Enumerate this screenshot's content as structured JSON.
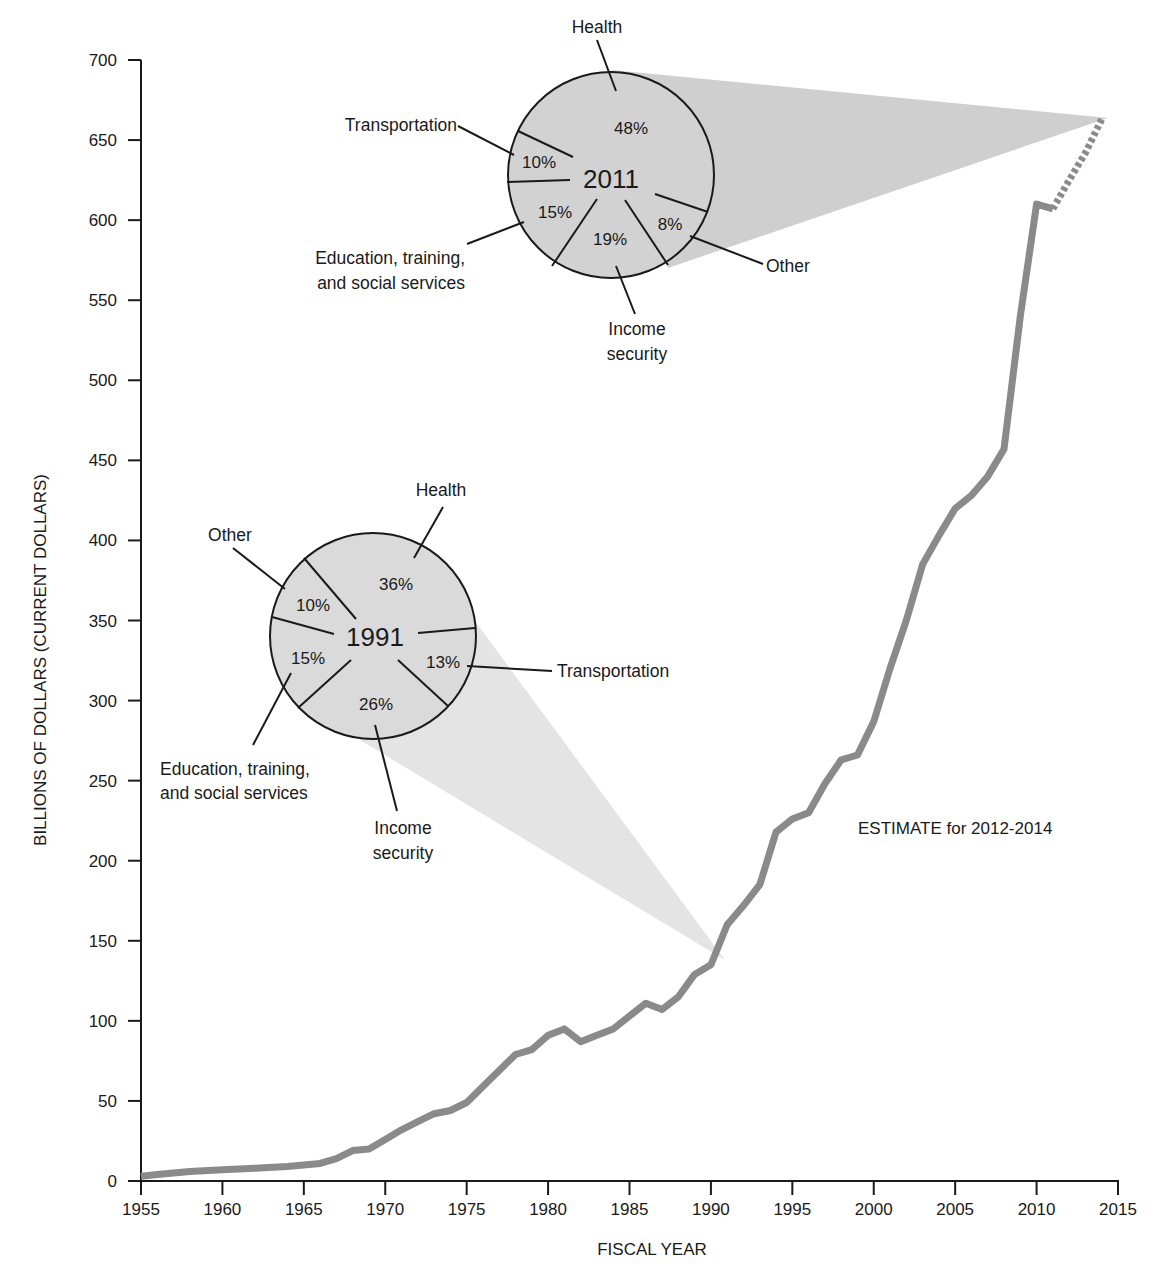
{
  "chart_data": {
    "type": "line",
    "title": "",
    "xlabel": "FISCAL YEAR",
    "ylabel": "BILLIONS OF DOLLARS (CURRENT DOLLARS)",
    "xlim": [
      1955,
      2015
    ],
    "ylim": [
      0,
      700
    ],
    "grid": false,
    "x_ticks": [
      "1955",
      "1960",
      "1965",
      "1970",
      "1975",
      "1980",
      "1985",
      "1990",
      "1995",
      "2000",
      "2005",
      "2010",
      "2015"
    ],
    "y_ticks": [
      "0",
      "50",
      "100",
      "150",
      "200",
      "250",
      "300",
      "350",
      "400",
      "450",
      "500",
      "550",
      "600",
      "650",
      "700"
    ],
    "series": [
      {
        "name": "Federal grants to state and local governments (actual)",
        "style": "solid",
        "color": "#8a8a8a",
        "x": [
          1955,
          1956,
          1958,
          1960,
          1962,
          1964,
          1966,
          1967,
          1968,
          1969,
          1970,
          1971,
          1972,
          1973,
          1974,
          1975,
          1976,
          1977,
          1978,
          1979,
          1980,
          1981,
          1982,
          1983,
          1984,
          1985,
          1986,
          1987,
          1988,
          1989,
          1990,
          1991,
          1992,
          1993,
          1994,
          1995,
          1996,
          1997,
          1998,
          1999,
          2000,
          2001,
          2002,
          2003,
          2004,
          2005,
          2006,
          2007,
          2008,
          2009,
          2010,
          2011
        ],
        "values": [
          3,
          4,
          6,
          7,
          8,
          9,
          11,
          14,
          19,
          20,
          26,
          32,
          37,
          42,
          44,
          49,
          59,
          69,
          79,
          82,
          91,
          95,
          87,
          91,
          95,
          103,
          111,
          107,
          115,
          129,
          135,
          160,
          172,
          185,
          218,
          226,
          230,
          248,
          263,
          266,
          287,
          320,
          350,
          385,
          403,
          420,
          428,
          440,
          457,
          540,
          610,
          607
        ]
      },
      {
        "name": "Estimate",
        "style": "dashed",
        "color": "#8a8a8a",
        "x": [
          2011,
          2012,
          2013,
          2014
        ],
        "values": [
          607,
          625,
          642,
          663
        ]
      }
    ],
    "annotations": [
      "ESTIMATE for 2012-2014"
    ],
    "insets": [
      {
        "type": "pie",
        "year": "1991",
        "slices": [
          {
            "label": "Health",
            "value": 36
          },
          {
            "label": "Transportation",
            "value": 13
          },
          {
            "label": "Income security",
            "value": 26
          },
          {
            "label": "Education, training, and social services",
            "value": 15
          },
          {
            "label": "Other",
            "value": 10
          }
        ]
      },
      {
        "type": "pie",
        "year": "2011",
        "slices": [
          {
            "label": "Health",
            "value": 48
          },
          {
            "label": "Other",
            "value": 8
          },
          {
            "label": "Income security",
            "value": 19
          },
          {
            "label": "Education, training, and social services",
            "value": 15
          },
          {
            "label": "Transportation",
            "value": 10
          }
        ]
      }
    ]
  },
  "axes": {
    "xlabel": "FISCAL YEAR",
    "ylabel": "BILLIONS OF DOLLARS (CURRENT DOLLARS)"
  },
  "annotation": "ESTIMATE for 2012-2014",
  "pie1991": {
    "year": "1991",
    "health_label": "Health",
    "health_pct": "36%",
    "transport_label": "Transportation",
    "transport_pct": "13%",
    "income_label1": "Income",
    "income_label2": "security",
    "income_pct": "26%",
    "edu_label1": "Education, training,",
    "edu_label2": "and social services",
    "edu_pct": "15%",
    "other_label": "Other",
    "other_pct": "10%"
  },
  "pie2011": {
    "year": "2011",
    "health_label": "Health",
    "health_pct": "48%",
    "transport_label": "Transportation",
    "transport_pct": "10%",
    "income_label1": "Income",
    "income_label2": "security",
    "income_pct": "19%",
    "edu_label1": "Education, training,",
    "edu_label2": "and social services",
    "edu_pct": "15%",
    "other_label": "Other",
    "other_pct": "8%"
  },
  "colors": {
    "line": "#8a8a8a",
    "pie_fill": "#d2d2d2",
    "wedge_2011": "#cfcfcf",
    "wedge_1991": "#e4e4e4",
    "axis": "#1a1a1a"
  }
}
